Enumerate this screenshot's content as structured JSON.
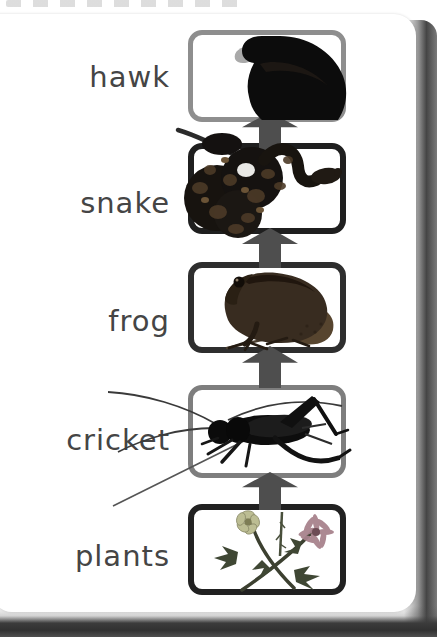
{
  "diagram": {
    "type": "food-chain",
    "flow_direction": "bottom-to-top",
    "levels": [
      {
        "label": "hawk",
        "image": "hawk-photo",
        "box_border_color": "#8e8e8e"
      },
      {
        "label": "snake",
        "image": "snake-photo",
        "box_border_color": "#1f1f1f"
      },
      {
        "label": "frog",
        "image": "frog-photo",
        "box_border_color": "#2e2e2e"
      },
      {
        "label": "cricket",
        "image": "cricket-photo",
        "box_border_color": "#7e7e7e"
      },
      {
        "label": "plants",
        "image": "plants-photo",
        "box_border_color": "#212121"
      }
    ],
    "arrows": {
      "count": 4,
      "direction": "up",
      "color": "#4e4e4e"
    }
  },
  "style": {
    "label_color": "#454545",
    "paper_color": "#ffffff",
    "edge_shadow_color": "#3d3d3d"
  }
}
